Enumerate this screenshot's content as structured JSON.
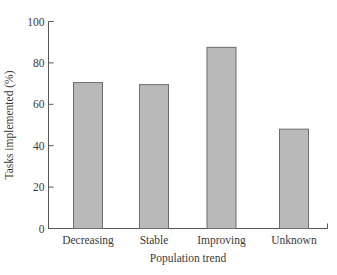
{
  "chart_data": {
    "type": "bar",
    "title": "",
    "xlabel": "Population trend",
    "ylabel": "Tasks implemented (%)",
    "categories": [
      "Decreasing",
      "Stable",
      "Improving",
      "Unknown"
    ],
    "values": [
      70.5,
      69.5,
      87.5,
      48
    ],
    "ylim": [
      0,
      100
    ],
    "yticks": [
      0,
      20,
      40,
      60,
      80,
      100
    ],
    "grid": false,
    "legend": null,
    "bar_color": "#b9b9b9",
    "bar_edge_color": "#6e6e6e"
  }
}
